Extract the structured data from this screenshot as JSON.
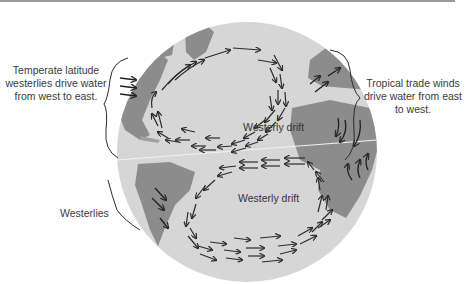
{
  "diagram": {
    "type": "ocean-current-gyres-on-globe",
    "annotations": {
      "temperate": "Temperate latitude westerlies drive water from west to east.",
      "tropical": "Tropical trade winds drive water from east to west.",
      "westerlies": "Westerlies"
    },
    "map_labels": {
      "drift_north": "Westerly drift",
      "drift_south": "Westerly drift"
    },
    "colors": {
      "ocean": "#d6d6d6",
      "land": "#8c8c8c",
      "arrows": "#2b2b2b",
      "text": "#3a3a3a"
    }
  }
}
